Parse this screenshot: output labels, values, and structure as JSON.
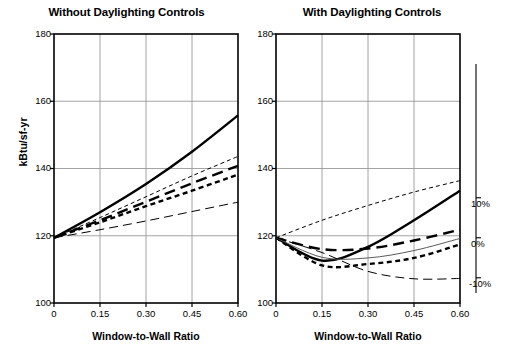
{
  "figure": {
    "width": 507,
    "height": 354,
    "background": "#ffffff",
    "axis_color": "#000000",
    "grid_color": "#9a9a9a"
  },
  "chart_data": [
    {
      "type": "line",
      "panel_id": "left",
      "title": "Without Daylighting Controls",
      "xlabel": "Window-to-Wall Ratio",
      "ylabel": "kBtu/sf-yr",
      "xlim": [
        0,
        0.6
      ],
      "ylim": [
        100,
        180
      ],
      "xticks": [
        0,
        0.15,
        0.3,
        0.45,
        0.6
      ],
      "xticklabels": [
        "0",
        "0.15",
        "0.30",
        "0.45",
        "0.60"
      ],
      "yticks": [
        100,
        120,
        140,
        160,
        180
      ],
      "yticklabels": [
        "100",
        "120",
        "140",
        "160",
        "180"
      ],
      "grid": true,
      "legend": "none",
      "right_axis": null,
      "x": [
        0,
        0.15,
        0.3,
        0.45,
        0.6
      ],
      "series": [
        {
          "name": "series-1-solid-thick",
          "style": "solid",
          "width": 2.4,
          "color": "#000000",
          "values": [
            119.4,
            127.0,
            135.4,
            145.0,
            155.8
          ]
        },
        {
          "name": "series-2-thin-dotted",
          "style": "short-dash-thin",
          "width": 1.0,
          "color": "#000000",
          "values": [
            119.4,
            125.4,
            131.6,
            137.8,
            143.6
          ]
        },
        {
          "name": "series-3-thick-long-dash",
          "style": "long-dash-thick",
          "width": 2.4,
          "color": "#000000",
          "values": [
            119.4,
            124.6,
            130.1,
            135.6,
            140.8
          ]
        },
        {
          "name": "series-4-thick-short-dash",
          "style": "short-dash-thick",
          "width": 2.4,
          "color": "#000000",
          "values": [
            119.4,
            124.0,
            128.8,
            133.4,
            138.2
          ]
        },
        {
          "name": "series-5-thin-long-dash",
          "style": "long-dash-thin",
          "width": 1.0,
          "color": "#000000",
          "values": [
            119.4,
            121.8,
            124.4,
            127.2,
            130.0
          ]
        }
      ]
    },
    {
      "type": "line",
      "panel_id": "right",
      "title": "With Daylighting Controls",
      "xlabel": "Window-to-Wall Ratio",
      "ylabel": "",
      "xlim": [
        0,
        0.6
      ],
      "ylim": [
        100,
        180
      ],
      "xticks": [
        0,
        0.15,
        0.3,
        0.45,
        0.6
      ],
      "xticklabels": [
        "0",
        "0.15",
        "0.30",
        "0.45",
        "0.60"
      ],
      "yticks": [
        100,
        120,
        140,
        160,
        180
      ],
      "yticklabels": [
        "100",
        "120",
        "140",
        "160",
        "180"
      ],
      "grid": true,
      "legend": "none",
      "right_axis": {
        "label": "",
        "ticks": [
          10,
          0,
          -10
        ],
        "ticklabels": [
          "10%",
          "0%",
          "-10%"
        ],
        "tick_values_kbtu": [
          131.3,
          119.4,
          107.5
        ]
      },
      "x": [
        0,
        0.15,
        0.3,
        0.45,
        0.6
      ],
      "series": [
        {
          "name": "series-1-solid-thick",
          "style": "solid",
          "width": 2.4,
          "color": "#000000",
          "values": [
            119.4,
            112.6,
            116.7,
            124.6,
            133.4
          ]
        },
        {
          "name": "series-2-thin-dotted",
          "style": "short-dash-thin",
          "width": 1.0,
          "color": "#000000",
          "values": [
            119.4,
            124.6,
            129.0,
            133.0,
            136.4
          ]
        },
        {
          "name": "series-3-thick-long-dash",
          "style": "long-dash-thick",
          "width": 2.4,
          "color": "#000000",
          "values": [
            119.4,
            116.0,
            116.2,
            118.6,
            121.8
          ]
        },
        {
          "name": "series-4-thick-short-dash",
          "style": "short-dash-thick",
          "width": 2.4,
          "color": "#000000",
          "values": [
            119.4,
            111.2,
            111.6,
            113.4,
            117.4
          ]
        },
        {
          "name": "series-5-thin-solid",
          "style": "solid-thin",
          "width": 1.0,
          "color": "#5a5a5a",
          "values": [
            119.4,
            113.6,
            113.4,
            115.6,
            119.2
          ]
        },
        {
          "name": "series-6-thin-long-dash",
          "style": "long-dash-thin",
          "width": 1.0,
          "color": "#000000",
          "values": [
            119.4,
            115.0,
            109.4,
            107.2,
            107.3
          ]
        }
      ]
    }
  ]
}
